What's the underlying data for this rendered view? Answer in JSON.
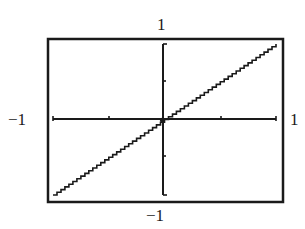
{
  "chart_data": {
    "type": "line",
    "title": "",
    "xlabel": "",
    "ylabel": "",
    "xlim": [
      -1,
      1
    ],
    "ylim": [
      -1,
      1
    ],
    "grid": false,
    "legend": "none",
    "series": [
      {
        "name": "y = x",
        "x": [
          -1,
          1
        ],
        "y": [
          -1,
          1
        ]
      }
    ],
    "x_ticks": [
      -1,
      -0.5,
      0,
      0.5,
      1
    ],
    "y_ticks": [
      -1,
      -0.5,
      0,
      0.5,
      1
    ],
    "window_labels": {
      "xmin": "−1",
      "xmax": "1",
      "ymin": "−1",
      "ymax": "1"
    }
  },
  "colors": {
    "ink": "#1a1a1a",
    "background": "#ffffff"
  }
}
